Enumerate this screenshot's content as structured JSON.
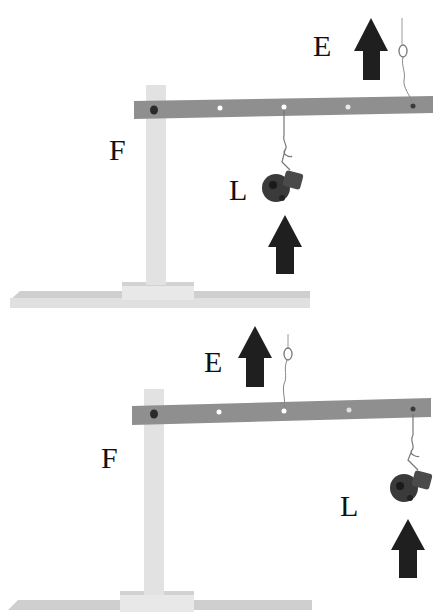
{
  "diagram": {
    "colors": {
      "beam": "#8f8f8f",
      "post": "#e2e2e2",
      "base": "#d9d9d9",
      "arrow": "#1f1f1f",
      "load": "#3a3a3a",
      "hole": "#ffffff",
      "pivot": "#2a2a2a",
      "label": "#111111"
    },
    "panels": [
      {
        "id": "top",
        "labels": {
          "fulcrum": "F",
          "load": "L",
          "effort": "E"
        },
        "description": "Load hangs at middle hole; effort string at far-right end"
      },
      {
        "id": "bottom",
        "labels": {
          "fulcrum": "F",
          "load": "L",
          "effort": "E"
        },
        "description": "Effort string at middle hole; load hangs at far-right end"
      }
    ]
  }
}
